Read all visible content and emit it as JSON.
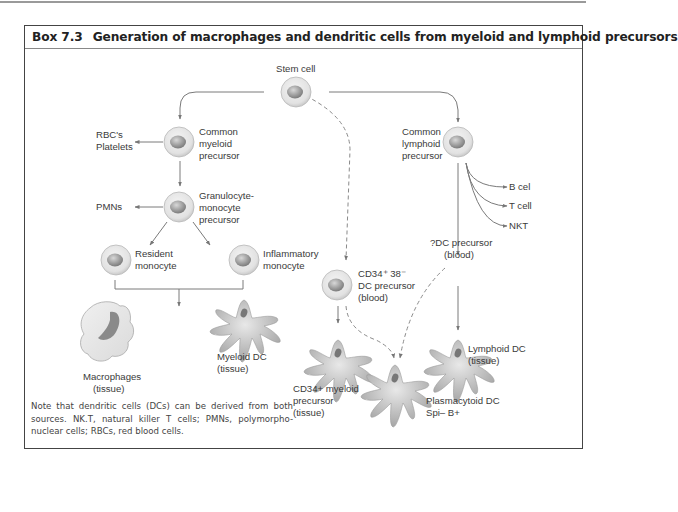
{
  "box": {
    "number": "Box 7.3",
    "title": "Generation of macrophages and dendritic cells from myeloid and lymphoid precursors"
  },
  "nodes": {
    "stem_cell": "Stem cell",
    "cmp": [
      "Common",
      "myeloid",
      "precursor"
    ],
    "rbc": [
      "RBC's",
      "Platelets"
    ],
    "gmp": [
      "Granulocyte-",
      "monocyte",
      "precursor"
    ],
    "pmn": "PMNs",
    "resident": [
      "Resident",
      "monocyte"
    ],
    "inflammatory": [
      "Inflammatory",
      "monocyte"
    ],
    "macrophages": [
      "Macrophages",
      "(tissue)"
    ],
    "myeloid_dc": [
      "Myeloid DC",
      "(tissue)"
    ],
    "clp": [
      "Common",
      "lymphoid",
      "precursor"
    ],
    "b_cell": "B cel",
    "t_cell": "T cell",
    "nkt": "NKT",
    "dc_precursor_q": [
      "?DC precursor",
      "(blood)"
    ],
    "cd34_precursor": [
      "CD34⁺ 38⁻",
      "DC precursor",
      "(blood)"
    ],
    "cd34_myeloid": [
      "CD34+ myeloid",
      "precursor",
      "(tissue)"
    ],
    "plasmacytoid": [
      "Plasmacytoid DC",
      "Spi– B+"
    ],
    "lymphoid_dc": [
      "Lymphoid DC",
      "(tissue)"
    ]
  },
  "note": "Note that dendritic cells (DCs) can be derived from both sources. NK.T, natural killer T cells; PMNs, polymorpho-nuclear cells; RBCs, red blood cells.",
  "colors": {
    "cell_fill": "#e6e6e6",
    "nucleus": "#9a9a9a",
    "arrow": "#777777",
    "frame": "#444444"
  }
}
